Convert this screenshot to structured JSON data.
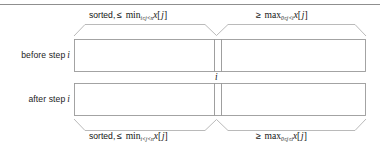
{
  "figure": {
    "top_rule": true,
    "rows": [
      {
        "id": "before",
        "label": "before step",
        "label_var": "i",
        "brace_position": "top",
        "left_segment": {
          "text_prefix": "sorted,",
          "relation": "≤",
          "operator": "min",
          "subscript": "i≤j<n",
          "array": "x",
          "index": "j"
        },
        "right_segment": {
          "text_prefix": "",
          "relation": "≥",
          "operator": "max",
          "subscript": "0≤j<i",
          "array": "x",
          "index": "j"
        }
      },
      {
        "id": "after",
        "label": "after step",
        "label_var": "i",
        "brace_position": "bottom",
        "left_segment": {
          "text_prefix": "sorted,",
          "relation": "≤",
          "operator": "min",
          "subscript": "i<j<n",
          "array": "x",
          "index": "j"
        },
        "right_segment": {
          "text_prefix": "",
          "relation": "≥",
          "operator": "max",
          "subscript": "0≤j≤i",
          "array": "x",
          "index": "j"
        }
      }
    ],
    "center_marker": "i",
    "colors": {
      "stroke": "#9a9a9a",
      "rule": "#8f8f8f",
      "text": "#1a1a1a"
    }
  }
}
